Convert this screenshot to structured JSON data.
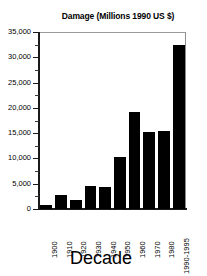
{
  "chart_data": {
    "type": "bar",
    "title": "Damage (Millions 1990 US $)",
    "xlabel": "Decade",
    "ylabel": "",
    "categories": [
      "1900",
      "1910",
      "1920",
      "1930",
      "1940",
      "1950",
      "1960",
      "1970",
      "1980",
      "1990-1995"
    ],
    "values": [
      800,
      2700,
      1800,
      4600,
      4400,
      10300,
      19100,
      15200,
      15400,
      32400
    ],
    "ylim": [
      0,
      35000
    ],
    "ytick_values": [
      0,
      5000,
      10000,
      15000,
      20000,
      25000,
      30000,
      35000
    ],
    "ytick_labels": [
      "0",
      "5,000",
      "10,000",
      "15,000",
      "20,000",
      "25,000",
      "30,000",
      "35,000"
    ],
    "grid": false,
    "legend": false,
    "bar_color": "#000000",
    "frame_color": "#8e8e8e",
    "background": "#ffffff"
  }
}
